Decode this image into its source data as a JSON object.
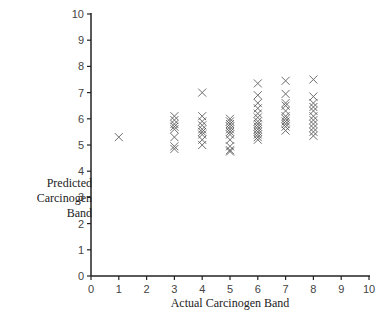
{
  "chart_data": {
    "type": "scatter",
    "title": "",
    "xlabel": "Actual Carcinogen Band",
    "ylabel_lines": [
      "Predicted",
      "Carcinogen",
      "Band"
    ],
    "xlim": [
      0,
      10
    ],
    "ylim": [
      0,
      10
    ],
    "x_ticks": [
      0,
      1,
      2,
      3,
      4,
      5,
      6,
      7,
      8,
      9,
      10
    ],
    "y_ticks": [
      0,
      1,
      2,
      3,
      4,
      5,
      6,
      7,
      8,
      9,
      10
    ],
    "grid": false,
    "legend": null,
    "marker": "x",
    "marker_color": "#555555",
    "points": [
      {
        "x": 1,
        "y": 5.3
      },
      {
        "x": 3,
        "y": 6.1
      },
      {
        "x": 3,
        "y": 5.95
      },
      {
        "x": 3,
        "y": 5.8
      },
      {
        "x": 3,
        "y": 5.7
      },
      {
        "x": 3,
        "y": 5.6
      },
      {
        "x": 3,
        "y": 5.3
      },
      {
        "x": 3,
        "y": 4.95
      },
      {
        "x": 3,
        "y": 4.85
      },
      {
        "x": 4,
        "y": 7.0
      },
      {
        "x": 4,
        "y": 6.1
      },
      {
        "x": 4,
        "y": 5.9
      },
      {
        "x": 4,
        "y": 5.75
      },
      {
        "x": 4,
        "y": 5.6
      },
      {
        "x": 4,
        "y": 5.5
      },
      {
        "x": 4,
        "y": 5.4
      },
      {
        "x": 4,
        "y": 5.2
      },
      {
        "x": 4,
        "y": 5.0
      },
      {
        "x": 5,
        "y": 6.0
      },
      {
        "x": 5,
        "y": 5.9
      },
      {
        "x": 5,
        "y": 5.8
      },
      {
        "x": 5,
        "y": 5.7
      },
      {
        "x": 5,
        "y": 5.6
      },
      {
        "x": 5,
        "y": 5.5
      },
      {
        "x": 5,
        "y": 5.4
      },
      {
        "x": 5,
        "y": 5.2
      },
      {
        "x": 5,
        "y": 4.95
      },
      {
        "x": 5,
        "y": 4.8
      },
      {
        "x": 5,
        "y": 4.75
      },
      {
        "x": 6,
        "y": 7.35
      },
      {
        "x": 6,
        "y": 6.9
      },
      {
        "x": 6,
        "y": 6.6
      },
      {
        "x": 6,
        "y": 6.4
      },
      {
        "x": 6,
        "y": 6.2
      },
      {
        "x": 6,
        "y": 6.05
      },
      {
        "x": 6,
        "y": 5.9
      },
      {
        "x": 6,
        "y": 5.8
      },
      {
        "x": 6,
        "y": 5.7
      },
      {
        "x": 6,
        "y": 5.6
      },
      {
        "x": 6,
        "y": 5.5
      },
      {
        "x": 6,
        "y": 5.4
      },
      {
        "x": 6,
        "y": 5.3
      },
      {
        "x": 6,
        "y": 5.2
      },
      {
        "x": 7,
        "y": 7.45
      },
      {
        "x": 7,
        "y": 6.95
      },
      {
        "x": 7,
        "y": 6.6
      },
      {
        "x": 7,
        "y": 6.5
      },
      {
        "x": 7,
        "y": 6.3
      },
      {
        "x": 7,
        "y": 6.1
      },
      {
        "x": 7,
        "y": 6.0
      },
      {
        "x": 7,
        "y": 5.9
      },
      {
        "x": 7,
        "y": 5.8
      },
      {
        "x": 7,
        "y": 5.7
      },
      {
        "x": 7,
        "y": 5.55
      },
      {
        "x": 8,
        "y": 7.5
      },
      {
        "x": 8,
        "y": 6.85
      },
      {
        "x": 8,
        "y": 6.6
      },
      {
        "x": 8,
        "y": 6.45
      },
      {
        "x": 8,
        "y": 6.3
      },
      {
        "x": 8,
        "y": 6.1
      },
      {
        "x": 8,
        "y": 5.95
      },
      {
        "x": 8,
        "y": 5.8
      },
      {
        "x": 8,
        "y": 5.65
      },
      {
        "x": 8,
        "y": 5.5
      },
      {
        "x": 8,
        "y": 5.35
      }
    ]
  }
}
